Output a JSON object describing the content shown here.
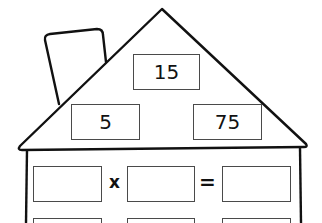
{
  "worksheet": {
    "type": "fact-family-house",
    "roof": {
      "top_number": "15",
      "left_number": "5",
      "right_number": "75"
    },
    "equations": [
      {
        "operand1": "",
        "operator": "x",
        "operand2": "",
        "equals": "=",
        "result": ""
      }
    ]
  },
  "colors": {
    "stroke": "#111111",
    "box_border": "#4a4a4a",
    "background": "#ffffff"
  }
}
